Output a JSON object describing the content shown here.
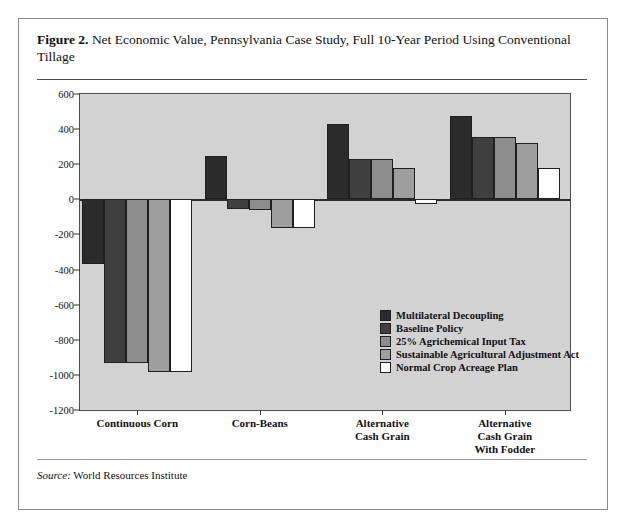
{
  "figure": {
    "label": "Figure 2.",
    "title": "Net Economic Value, Pennsylvania Case Study, Full 10-Year Period Using Conventional Tillage",
    "source_word": "Source:",
    "source_text": " World Resources Institute"
  },
  "chart_data": {
    "type": "bar",
    "title": "Net Economic Value, Pennsylvania Case Study, Full 10-Year Period Using Conventional Tillage",
    "xlabel": "",
    "ylabel": "Dollars Per Acre Per 10 Years",
    "ylim": [
      -1200,
      600
    ],
    "ytick_step": 200,
    "yticks": [
      600,
      400,
      200,
      0,
      -200,
      -400,
      -600,
      -800,
      -1000,
      -1200
    ],
    "ytick_labels": [
      "600",
      "400",
      "200",
      "0",
      "-200",
      "-400",
      "-600",
      "-800",
      "-1000",
      "-1200"
    ],
    "grid": false,
    "legend_position": "inside-center-right",
    "categories": [
      "Continuous Corn",
      "Corn-Beans",
      "Alternative\nCash Grain",
      "Alternative\nCash Grain\nWith Fodder"
    ],
    "series": [
      {
        "name": "Multilateral Decoupling",
        "color": "#2b2b2b",
        "values": [
          -370,
          245,
          430,
          475
        ]
      },
      {
        "name": "Baseline Policy",
        "color": "#3f3f3f",
        "values": [
          -930,
          -55,
          230,
          355
        ]
      },
      {
        "name": "25%  Agrichemical Input Tax",
        "color": "#8d8d8d",
        "values": [
          -935,
          -60,
          230,
          355
        ]
      },
      {
        "name": "Sustainable Agricultural Adjustment Act",
        "color": "#9e9e9e",
        "values": [
          -985,
          -165,
          180,
          320
        ]
      },
      {
        "name": "Normal Crop Acreage Plan",
        "color": "#ffffff",
        "values": [
          -985,
          -165,
          -25,
          180
        ]
      }
    ]
  }
}
